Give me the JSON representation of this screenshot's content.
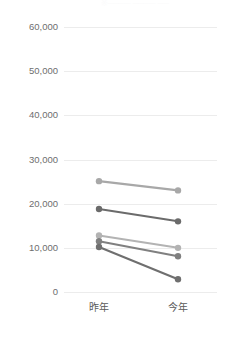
{
  "chart_data": {
    "type": "line",
    "title": "",
    "subtitle": "",
    "xlabel": "",
    "ylabel": "",
    "categories": [
      "昨年",
      "今年"
    ],
    "ylim": [
      0,
      60000
    ],
    "ytick_values": [
      60000,
      50000,
      40000,
      30000,
      20000,
      10000,
      0
    ],
    "ytick_labels": [
      "60,000",
      "50,000",
      "40,000",
      "30,000",
      "20,000",
      "10,000",
      "0"
    ],
    "grid": true,
    "legend": "none",
    "marker": "circle",
    "series": [
      {
        "name": "series-1",
        "color": "#a8a8a8",
        "values": [
          25100,
          23000
        ]
      },
      {
        "name": "series-2",
        "color": "#6b6b6b",
        "values": [
          18800,
          16000
        ]
      },
      {
        "name": "series-3",
        "color": "#b3b3b3",
        "values": [
          12800,
          10000
        ]
      },
      {
        "name": "series-4",
        "color": "#808080",
        "values": [
          11500,
          8100
        ]
      },
      {
        "name": "series-5",
        "color": "#6f6f6f",
        "values": [
          10200,
          2900
        ]
      }
    ]
  },
  "axes": {
    "x_positions_px": [
      99,
      178
    ],
    "y_top_px": 27,
    "y_bottom_px": 292
  },
  "top_clipped_text": "※──── ──── ──"
}
